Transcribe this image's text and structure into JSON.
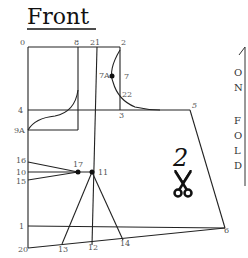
{
  "title": "Front",
  "pattern_piece_number": "2",
  "fold_label": [
    "O",
    "N",
    "",
    "F",
    "O",
    "L",
    "D"
  ],
  "points": {
    "p0": "0",
    "p8": "8",
    "p21": "21",
    "p2": "2",
    "p7a": "7A",
    "p7": "7",
    "p22": "22",
    "p3": "3",
    "p4": "4",
    "p5": "5",
    "p9a": "9A",
    "p16": "16",
    "p10": "10",
    "p15": "15",
    "p17": "17",
    "p11": "11",
    "p1": "1",
    "p6": "6",
    "p20": "20",
    "p13": "13",
    "p12": "12",
    "p14": "14"
  },
  "icons": {
    "scissors": "scissors-icon",
    "arrow": "arrow-up-icon"
  }
}
